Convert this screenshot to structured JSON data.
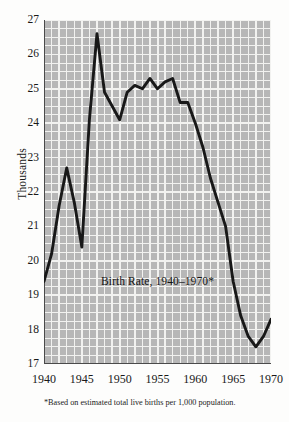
{
  "figure": {
    "ylabel": "Thousands",
    "title": "Birth Rate, 1940–1970*",
    "footnote": "*Based on estimated total live births per 1,000 population."
  },
  "colors": {
    "plot_background": "#b7b7b7",
    "gridline": "#f2f2f0",
    "line": "#181818",
    "axis": "#4a4a4a",
    "page_background": "#fdfdfc",
    "text": "#191919"
  },
  "chart_data": {
    "type": "line",
    "title": "Birth Rate, 1940–1970*",
    "xlabel": "",
    "ylabel": "Thousands",
    "xlim": [
      1940,
      1970
    ],
    "ylim": [
      17,
      27
    ],
    "yticks": [
      17,
      18,
      19,
      20,
      21,
      22,
      23,
      24,
      25,
      26,
      27
    ],
    "ytick_labels": [
      "17",
      "18",
      "19",
      "20",
      "21",
      "22",
      "23",
      "24",
      "25",
      "26",
      "27"
    ],
    "xticks": [
      1940,
      1945,
      1950,
      1955,
      1960,
      1965,
      1970
    ],
    "xtick_labels": [
      "1940",
      "1945",
      "1950",
      "1955",
      "1960",
      "1965",
      "1970"
    ],
    "x_minor_step": 1,
    "y_minor_step": 0.25,
    "grid": true,
    "legend": null,
    "annotations": [
      {
        "text": "Birth Rate, 1940–1970*",
        "x": 1955,
        "y": 19.6
      }
    ],
    "x": [
      1940,
      1941,
      1942,
      1943,
      1944,
      1945,
      1946,
      1947,
      1948,
      1949,
      1950,
      1951,
      1952,
      1953,
      1954,
      1955,
      1956,
      1957,
      1958,
      1959,
      1960,
      1961,
      1962,
      1963,
      1964,
      1965,
      1966,
      1967,
      1968,
      1969,
      1970
    ],
    "values": [
      19.4,
      20.2,
      21.6,
      22.7,
      21.7,
      20.4,
      24.1,
      26.6,
      24.9,
      24.5,
      24.1,
      24.9,
      25.1,
      25.0,
      25.3,
      25.0,
      25.2,
      25.3,
      24.6,
      24.6,
      24.0,
      23.3,
      22.4,
      21.7,
      21.0,
      19.4,
      18.4,
      17.8,
      17.5,
      17.8,
      18.3
    ],
    "series": [
      {
        "name": "Birth Rate",
        "values": [
          19.4,
          20.2,
          21.6,
          22.7,
          21.7,
          20.4,
          24.1,
          26.6,
          24.9,
          24.5,
          24.1,
          24.9,
          25.1,
          25.0,
          25.3,
          25.0,
          25.2,
          25.3,
          24.6,
          24.6,
          24.0,
          23.3,
          22.4,
          21.7,
          21.0,
          19.4,
          18.4,
          17.8,
          17.5,
          17.8,
          18.3
        ]
      }
    ]
  }
}
